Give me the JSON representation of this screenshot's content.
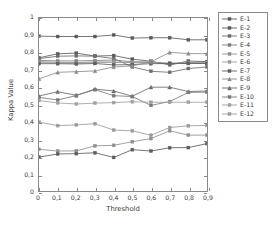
{
  "chart_data": {
    "type": "line",
    "title": "",
    "xlabel": "Threshold",
    "ylabel": "Kappa Value",
    "x": [
      0,
      0.1,
      0.2,
      0.3,
      0.4,
      0.5,
      0.6,
      0.7,
      0.8,
      0.9
    ],
    "x_tick_labels": [
      "0",
      "0,1",
      "0,2",
      "0,3",
      "0,4",
      "0,5",
      "0,6",
      "0,7",
      "0,8",
      "0,9"
    ],
    "y_tick_labels": [
      "0",
      "0,1",
      "0,2",
      "0,3",
      "0,4",
      "0,5",
      "0,6",
      "0,7",
      "0,8",
      "0,9",
      "1"
    ],
    "y_ticks": [
      0,
      0.1,
      0.2,
      0.3,
      0.4,
      0.5,
      0.6,
      0.7,
      0.8,
      0.9,
      1
    ],
    "xlim": [
      0,
      0.9
    ],
    "ylim": [
      0,
      1
    ],
    "grid": false,
    "legend_position": "right-outside",
    "series": [
      {
        "name": "E-1",
        "color": "#5a5a5a",
        "marker": "square",
        "values": [
          0.895,
          0.893,
          0.893,
          0.893,
          0.902,
          0.884,
          0.886,
          0.886,
          0.874,
          0.874
        ]
      },
      {
        "name": "E-2",
        "color": "#5a5a5a",
        "marker": "square",
        "values": [
          0.77,
          0.793,
          0.797,
          0.78,
          0.783,
          0.762,
          0.75,
          0.729,
          0.751,
          0.748
        ]
      },
      {
        "name": "E-3",
        "color": "#6d6d6d",
        "marker": "square",
        "values": [
          0.765,
          0.779,
          0.781,
          0.779,
          0.766,
          0.717,
          0.692,
          0.686,
          0.708,
          0.717
        ]
      },
      {
        "name": "E-4",
        "color": "#7e7e7e",
        "marker": "square",
        "values": [
          0.755,
          0.752,
          0.752,
          0.754,
          0.757,
          0.747,
          0.745,
          0.733,
          0.742,
          0.74
        ]
      },
      {
        "name": "E-5",
        "color": "#8e8e8e",
        "marker": "square",
        "values": [
          0.748,
          0.744,
          0.742,
          0.746,
          0.745,
          0.744,
          0.744,
          0.738,
          0.741,
          0.74
        ]
      },
      {
        "name": "E-6",
        "color": "#9b9b9b",
        "marker": "square",
        "values": [
          0.742,
          0.74,
          0.738,
          0.742,
          0.744,
          0.742,
          0.742,
          0.739,
          0.74,
          0.739
        ]
      },
      {
        "name": "E-7",
        "color": "#5f5f5f",
        "marker": "square",
        "values": [
          0.736,
          0.736,
          0.734,
          0.737,
          0.729,
          0.731,
          0.736,
          0.737,
          0.737,
          0.737
        ]
      },
      {
        "name": "E-8",
        "color": "#8b8b8b",
        "marker": "triangle",
        "values": [
          0.648,
          0.686,
          0.69,
          0.694,
          0.717,
          0.723,
          0.747,
          0.801,
          0.795,
          0.793
        ]
      },
      {
        "name": "E-9",
        "color": "#6a6a6a",
        "marker": "triangle",
        "values": [
          0.549,
          0.574,
          0.553,
          0.589,
          0.578,
          0.548,
          0.6,
          0.6,
          0.575,
          0.578
        ]
      },
      {
        "name": "E-10",
        "color": "#7a7a7a",
        "marker": "square",
        "values": [
          0.541,
          0.526,
          0.552,
          0.586,
          0.551,
          0.546,
          0.495,
          0.517,
          0.57,
          0.572
        ]
      },
      {
        "name": "E-11",
        "color": "#a0a0a0",
        "marker": "square",
        "values": [
          0.523,
          0.509,
          0.503,
          0.508,
          0.511,
          0.516,
          0.513,
          0.513,
          0.513,
          0.513
        ]
      },
      {
        "name": "E-12",
        "color": "#9a9a9a",
        "marker": "square",
        "values": [
          0.398,
          0.378,
          0.382,
          0.389,
          0.352,
          0.348,
          0.322,
          0.367,
          0.377,
          0.379
        ]
      },
      {
        "name": "E-13",
        "color": "#8f8f8f",
        "marker": "square",
        "values": [
          0.241,
          0.231,
          0.232,
          0.261,
          0.264,
          0.285,
          0.303,
          0.348,
          0.323,
          0.323
        ]
      },
      {
        "name": "E-14",
        "color": "#5c5c5c",
        "marker": "square",
        "values": [
          0.196,
          0.214,
          0.216,
          0.221,
          0.194,
          0.239,
          0.231,
          0.25,
          0.251,
          0.274
        ]
      }
    ]
  },
  "legend": {
    "entries": [
      {
        "label": "E-1"
      },
      {
        "label": "E-2"
      },
      {
        "label": "E-3"
      },
      {
        "label": "E-4"
      },
      {
        "label": "E-5"
      },
      {
        "label": "E-6"
      },
      {
        "label": "E-7"
      },
      {
        "label": "E-8"
      },
      {
        "label": "E-9"
      },
      {
        "label": "E-10"
      },
      {
        "label": "E-11"
      },
      {
        "label": "E-12"
      }
    ]
  },
  "style": {
    "axis_color": "#8a8a8a",
    "text_color": "#3a3a3a",
    "background": "#ffffff"
  }
}
